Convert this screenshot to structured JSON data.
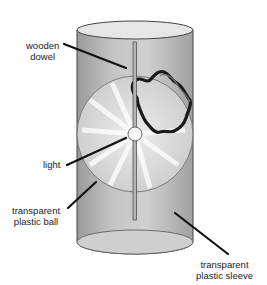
{
  "diagram": {
    "labels": {
      "dowel_line1": "wooden",
      "dowel_line2": "dowel",
      "light": "light",
      "ball_line1": "transparent",
      "ball_line2": "plastic ball",
      "sleeve_line1": "transparent",
      "sleeve_line2": "plastic sleeve"
    },
    "colors": {
      "sleeve_fill": "#bdbdbd",
      "ball_fill": "#d8d8d8",
      "outline": "#555555",
      "leader": "#111111"
    }
  }
}
